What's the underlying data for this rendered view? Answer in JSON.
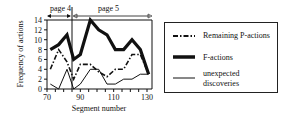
{
  "chart_data": {
    "type": "line",
    "title": "",
    "xlabel": "Segment number",
    "ylabel": "Frequency of actions",
    "xlim": [
      70,
      132
    ],
    "ylim": [
      0,
      14
    ],
    "x_ticks": [
      70,
      90,
      110,
      130
    ],
    "y_ticks": [
      0,
      2,
      4,
      6,
      8,
      10,
      12,
      14
    ],
    "grid": false,
    "legend_position": "right",
    "annotations": [
      {
        "label": "page 4",
        "x_range": [
          70,
          86
        ]
      },
      {
        "label": "page 5",
        "x_range": [
          86,
          132
        ]
      }
    ],
    "x": [
      72,
      77,
      82,
      86,
      90,
      96,
      101,
      106,
      111,
      116,
      121,
      126,
      131
    ],
    "series": [
      {
        "name": "Remaining P-actions",
        "style": "dash-dot",
        "values": [
          4,
          8,
          5.5,
          2,
          5,
          5,
          3.5,
          2.5,
          4,
          4,
          7,
          7,
          3
        ]
      },
      {
        "name": "F-actions",
        "style": "thick-solid",
        "values": [
          8,
          9,
          11,
          6,
          7,
          14,
          12,
          11,
          8,
          8,
          10,
          8,
          3
        ]
      },
      {
        "name": "unexpected discoveries",
        "style": "thin-solid",
        "values": [
          1,
          0,
          4,
          0,
          1,
          4,
          4,
          1,
          1,
          2,
          2,
          3,
          3
        ]
      }
    ]
  },
  "axes": {
    "xlabel": "Segment number",
    "ylabel": "Frequency of actions",
    "x_tick_labels": [
      "70",
      "90",
      "110",
      "130"
    ],
    "y_tick_labels": [
      "0",
      "2",
      "4",
      "6",
      "8",
      "10",
      "12",
      "14"
    ]
  },
  "annotations": {
    "page4": "page 4",
    "page5": "page 5"
  },
  "legend": {
    "items": [
      {
        "label": "Remaining P-actions"
      },
      {
        "label": "F-actions"
      },
      {
        "label_line1": "unexpected",
        "label_line2": "discoveries"
      }
    ]
  }
}
